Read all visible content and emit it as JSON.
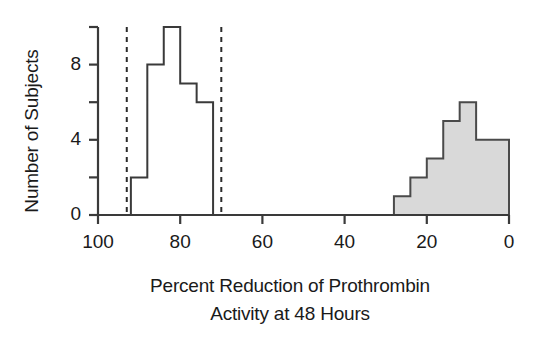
{
  "chart_data": {
    "type": "bar",
    "title": "",
    "xlabel": "Percent Reduction of Prothrombin Activity at 48 Hours",
    "xlabel_line1": "Percent Reduction of Prothrombin",
    "xlabel_line2": "Activity at 48 Hours",
    "ylabel": "Number of Subjects",
    "xlim": [
      100,
      0
    ],
    "ylim": [
      0,
      10
    ],
    "x_reversed": true,
    "xticks": [
      100,
      80,
      60,
      40,
      20,
      0
    ],
    "xtick_labels": [
      "100",
      "80",
      "60",
      "40",
      "20",
      "0"
    ],
    "yticks": [
      0,
      2,
      4,
      6,
      8,
      10
    ],
    "ytick_labels": [
      "0",
      "",
      "4",
      "",
      "8",
      ""
    ],
    "ytick_labels_shown": [
      "0",
      "4",
      "8"
    ],
    "grid": false,
    "legend": null,
    "series": [
      {
        "name": "Responders (open)",
        "style": "open-step",
        "fill": "none",
        "stroke": "#3a3a3a",
        "bin_width": 4,
        "bins": [
          {
            "x_start": 92,
            "x_end": 88,
            "value": 2
          },
          {
            "x_start": 88,
            "x_end": 84,
            "value": 8
          },
          {
            "x_start": 84,
            "x_end": 80,
            "value": 10
          },
          {
            "x_start": 80,
            "x_end": 76,
            "value": 7
          },
          {
            "x_start": 76,
            "x_end": 72,
            "value": 6
          }
        ]
      },
      {
        "name": "Non-responders (shaded)",
        "style": "filled-step",
        "fill": "#d9d9d9",
        "stroke": "#4a4a4a",
        "bin_width": 4,
        "bins": [
          {
            "x_start": 28,
            "x_end": 24,
            "value": 1
          },
          {
            "x_start": 24,
            "x_end": 20,
            "value": 2
          },
          {
            "x_start": 20,
            "x_end": 16,
            "value": 3
          },
          {
            "x_start": 16,
            "x_end": 12,
            "value": 5
          },
          {
            "x_start": 12,
            "x_end": 8,
            "value": 6
          },
          {
            "x_start": 8,
            "x_end": 0,
            "value": 4
          }
        ]
      }
    ],
    "reference_lines": [
      {
        "x": 93,
        "style": "dashed",
        "color": "#2b2b2b"
      },
      {
        "x": 70,
        "style": "dashed",
        "color": "#2b2b2b"
      }
    ],
    "axis_color": "#3a3a3a"
  }
}
